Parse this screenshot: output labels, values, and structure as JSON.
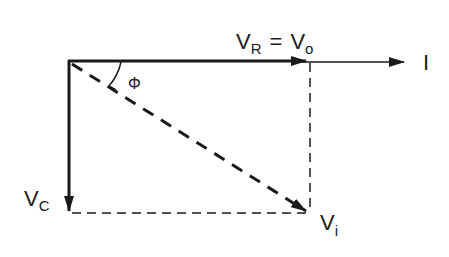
{
  "diagram": {
    "labels": {
      "vr_main": "V",
      "vr_sub": "R",
      "equals": "=",
      "vo_main": "V",
      "vo_sub": "o",
      "current": "I",
      "vc_main": "V",
      "vc_sub": "C",
      "vi_main": "V",
      "vi_sub": "i",
      "phase_angle": "Φ"
    },
    "phasors": [
      {
        "name": "V_R = V_o",
        "direction": "right",
        "style": "solid-thick"
      },
      {
        "name": "I",
        "direction": "right",
        "style": "solid-thin"
      },
      {
        "name": "V_C",
        "direction": "down",
        "style": "solid-thick"
      },
      {
        "name": "V_i",
        "direction": "down-right",
        "style": "dashed-thick"
      }
    ],
    "colors": {
      "stroke": "#1a1a1a",
      "background": "#ffffff"
    }
  }
}
